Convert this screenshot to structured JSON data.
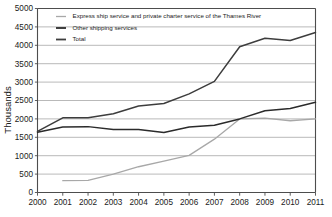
{
  "chart_data": {
    "type": "line",
    "title": "",
    "xlabel": "",
    "ylabel": "Thousands",
    "x": [
      2000,
      2001,
      2002,
      2003,
      2004,
      2005,
      2006,
      2007,
      2008,
      2009,
      2010,
      2011
    ],
    "xtick_labels": [
      "2000",
      "2001",
      "2002",
      "2003",
      "2004",
      "2005",
      "2006",
      "2007",
      "2008",
      "2009",
      "2010",
      "2011"
    ],
    "ytick_labels": [
      "0",
      "500",
      "1000",
      "1500",
      "2000",
      "2500",
      "3000",
      "3500",
      "4000",
      "4500",
      "5000"
    ],
    "yticks": [
      0,
      500,
      1000,
      1500,
      2000,
      2500,
      3000,
      3500,
      4000,
      4500,
      5000
    ],
    "ylim": [
      0,
      5000
    ],
    "xlim": [
      2000,
      2011
    ],
    "grid": true,
    "legend_position": "top-left-inside",
    "series": [
      {
        "name": "Express ship service and private charter service of the Thames River",
        "color": "#a8a8a8",
        "width": 1.3,
        "x": [
          2001,
          2002,
          2003,
          2004,
          2005,
          2006,
          2007,
          2008,
          2009,
          2010,
          2011
        ],
        "values": [
          320,
          330,
          500,
          700,
          850,
          1010,
          1450,
          2000,
          2020,
          1950,
          2000
        ]
      },
      {
        "name": "Other shipping services",
        "color": "#2b2b2b",
        "width": 1.5,
        "x": [
          2000,
          2001,
          2002,
          2003,
          2004,
          2005,
          2006,
          2007,
          2008,
          2009,
          2010,
          2011
        ],
        "values": [
          1640,
          1780,
          1790,
          1710,
          1710,
          1630,
          1780,
          1830,
          2000,
          2220,
          2280,
          2450
        ]
      },
      {
        "name": "Total",
        "color": "#3d3d3d",
        "width": 1.5,
        "x": [
          2000,
          2001,
          2002,
          2003,
          2004,
          2005,
          2006,
          2007,
          2008,
          2009,
          2010,
          2011
        ],
        "values": [
          1660,
          2030,
          2030,
          2140,
          2350,
          2420,
          2680,
          3020,
          3960,
          4190,
          4130,
          4350
        ]
      }
    ],
    "legend": [
      {
        "label": "Express ship service and private charter service of the Thames River",
        "color": "#a8a8a8",
        "width": 1.3
      },
      {
        "label": "Other shipping services",
        "color": "#2b2b2b",
        "width": 1.8
      },
      {
        "label": "Total",
        "color": "#3d3d3d",
        "width": 1.8
      }
    ]
  }
}
